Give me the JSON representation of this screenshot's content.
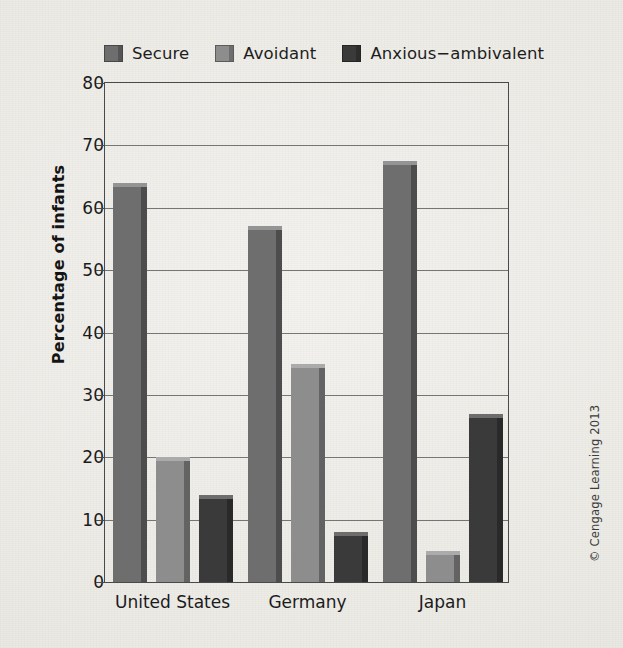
{
  "chart_data": {
    "type": "bar",
    "title": "",
    "subtitle": "",
    "xlabel": "",
    "ylabel": "Percentage of infants",
    "categories": [
      "United States",
      "Germany",
      "Japan"
    ],
    "series": [
      {
        "name": "Secure",
        "color": "#6e6e6e",
        "values": [
          64,
          57,
          67.5
        ]
      },
      {
        "name": "Avoidant",
        "color": "#8d8d8d",
        "values": [
          20,
          35,
          5
        ]
      },
      {
        "name": "Anxious−ambivalent",
        "color": "#3a3a3a",
        "values": [
          14,
          8,
          27
        ]
      }
    ],
    "ylim": [
      0,
      80
    ],
    "yticks": [
      0,
      10,
      20,
      30,
      40,
      50,
      60,
      70,
      80
    ],
    "ytick_labels": [
      "0",
      "10",
      "20",
      "30",
      "40",
      "50",
      "60",
      "70",
      "80"
    ],
    "grid": true,
    "legend_position": "top-left",
    "annotations": [
      "© Cengage Learning 2013"
    ]
  },
  "legend": {
    "items": [
      {
        "label": "Secure",
        "color": "#6e6e6e"
      },
      {
        "label": "Avoidant",
        "color": "#8d8d8d"
      },
      {
        "label": "Anxious−ambivalent",
        "color": "#3a3a3a"
      }
    ]
  },
  "axis": {
    "y_title": "Percentage of infants",
    "y_ticks": [
      "80",
      "70",
      "60",
      "50",
      "40",
      "30",
      "20",
      "10",
      "0"
    ],
    "x_ticks": [
      "United States",
      "Germany",
      "Japan"
    ]
  },
  "footer": {
    "copyright": "© Cengage Learning 2013"
  },
  "colors": {
    "secure": "#6e6e6e",
    "avoidant": "#8d8d8d",
    "anxious": "#3a3a3a",
    "background": "#eceae5",
    "axis": "#4a4a4a",
    "text": "#1b1b1b"
  }
}
